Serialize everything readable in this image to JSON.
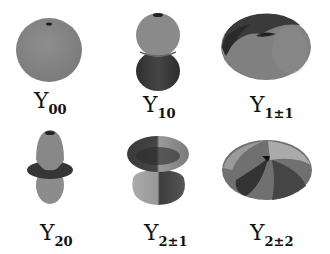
{
  "figure": {
    "items": [
      {
        "id": "Y00",
        "symbol": "Y",
        "subscript": "00"
      },
      {
        "id": "Y10",
        "symbol": "Y",
        "subscript": "10"
      },
      {
        "id": "Y1pm1",
        "symbol": "Y",
        "subscript": "1±1"
      },
      {
        "id": "Y20",
        "symbol": "Y",
        "subscript": "20"
      },
      {
        "id": "Y2pm1",
        "symbol": "Y",
        "subscript": "2±1"
      },
      {
        "id": "Y2pm2",
        "symbol": "Y",
        "subscript": "2±2"
      }
    ],
    "colors": {
      "light": "#8c8c8c",
      "mid": "#6e6e6e",
      "dark": "#3a3a3a",
      "background": "#ffffff"
    }
  }
}
